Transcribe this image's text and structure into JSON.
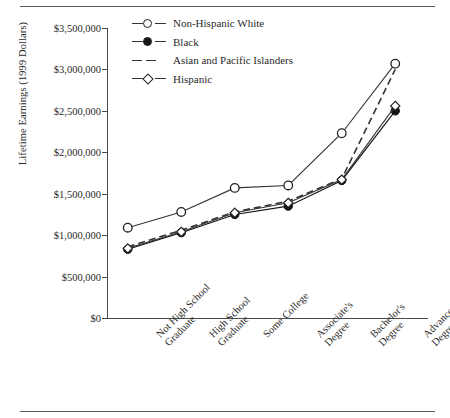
{
  "figure": {
    "ylabel": "Lifetime Earnings (1999 Dollars)",
    "ytick_labels": [
      "$3,500,000",
      "$3,000,000",
      "$2,500,000",
      "$2,000,000",
      "$1,500,000",
      "$1,000,000",
      "$500,000",
      "$0"
    ]
  },
  "chart_data": {
    "type": "line",
    "title": "",
    "xlabel": "",
    "ylabel": "Lifetime Earnings (1999 Dollars)",
    "ylim": [
      0,
      3500000
    ],
    "ytick_values": [
      0,
      500000,
      1000000,
      1500000,
      2000000,
      2500000,
      3000000,
      3500000
    ],
    "grid": false,
    "legend_position": "top-right-inside",
    "categories": [
      "Not High School Graduate",
      "High School Graduate",
      "Some College",
      "Associate's Degree",
      "Bachelor's Degree",
      "Advanced Degree"
    ],
    "category_lines": [
      [
        "Not High School",
        "Graduate"
      ],
      [
        "High School",
        "Graduate"
      ],
      [
        "Some College"
      ],
      [
        "Associate's",
        "Degree"
      ],
      [
        "Bachelor's",
        "Degree"
      ],
      [
        "Advanced",
        "Degree"
      ]
    ],
    "series": [
      {
        "name": "Non-Hispanic White",
        "marker": "open-circle",
        "line": "solid",
        "color": "#333333",
        "values": [
          1090000,
          1280000,
          1570000,
          1600000,
          2230000,
          3070000
        ]
      },
      {
        "name": "Black",
        "marker": "filled-circle",
        "line": "solid",
        "color": "#151515",
        "values": [
          830000,
          1030000,
          1250000,
          1350000,
          1660000,
          2500000
        ]
      },
      {
        "name": "Asian and Pacific Islanders",
        "marker": "none",
        "line": "dashed",
        "color": "#333333",
        "values": [
          860000,
          1060000,
          1280000,
          1410000,
          1680000,
          3000000
        ]
      },
      {
        "name": "Hispanic",
        "marker": "open-diamond",
        "line": "solid",
        "color": "#333333",
        "values": [
          840000,
          1040000,
          1270000,
          1390000,
          1670000,
          2560000
        ]
      }
    ]
  }
}
